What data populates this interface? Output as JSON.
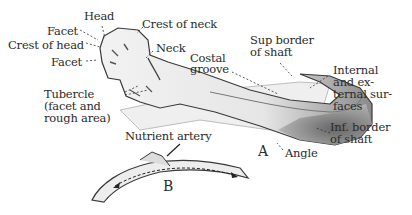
{
  "figure": {
    "view_a_label": "A",
    "view_b_label": "B",
    "labels": {
      "head": "Head",
      "facet_upper": "Facet",
      "crest_of_head": "Crest of head",
      "facet_lower": "Facet",
      "crest_of_neck": "Crest of neck",
      "neck": "Neck",
      "costal_groove_1": "Costal",
      "costal_groove_2": "groove",
      "sup_border_1": "Sup border",
      "sup_border_2": "of shaft",
      "int_ext_1": "Internal",
      "int_ext_2": "and ex-",
      "int_ext_3": "ternal sur-",
      "int_ext_4": "faces",
      "tubercle_1": "Tubercle",
      "tubercle_2": "(facet and",
      "tubercle_3": "rough area)",
      "inf_border_1": "Inf. border",
      "inf_border_2": "of shaft",
      "angle": "Angle",
      "nutrient_artery": "Nutrient artery"
    },
    "colors": {
      "ink": "#2b2b2b",
      "bone_light": "#e9e9e9",
      "bone_shadow": "#7a7a7a"
    }
  }
}
